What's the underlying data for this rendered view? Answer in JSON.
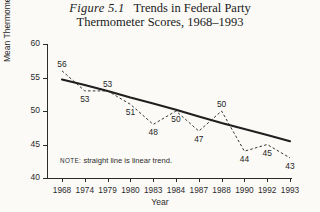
{
  "title": {
    "figure_number": "Figure 5.1",
    "line1": "Trends in Federal Party",
    "line2": "Thermometer Scores, 1968–1993"
  },
  "note": {
    "label": "NOTE:",
    "text": "straight line is linear trend."
  },
  "chart_data": {
    "type": "line",
    "xlabel": "Year",
    "ylabel": "Mean Thermometer Score",
    "ylim": [
      40,
      60
    ],
    "yticks": [
      60,
      55,
      50,
      45,
      40
    ],
    "grid": false,
    "legend": null,
    "categories": [
      "1968",
      "1974",
      "1979",
      "1980",
      "1983",
      "1984",
      "1987",
      "1988",
      "1990",
      "1992",
      "1993"
    ],
    "series": [
      {
        "name": "Mean thermometer score",
        "style": "dashed",
        "values": [
          56,
          53,
          53,
          51,
          48,
          50,
          47,
          50,
          44,
          45,
          43
        ]
      },
      {
        "name": "Linear trend",
        "style": "solid",
        "values": [
          54.7,
          53.9,
          53.0,
          52.0,
          51.1,
          50.2,
          49.2,
          48.2,
          47.3,
          46.4,
          45.5
        ]
      }
    ],
    "point_labels": [
      "56",
      "53",
      "53",
      "51",
      "48",
      "50",
      "47",
      "50",
      "44",
      "45",
      "43"
    ],
    "annotations": [
      "NOTE: straight line is linear trend."
    ]
  },
  "colors": {
    "ink": "#2b2b2b",
    "paper": "#fbfaf7"
  }
}
